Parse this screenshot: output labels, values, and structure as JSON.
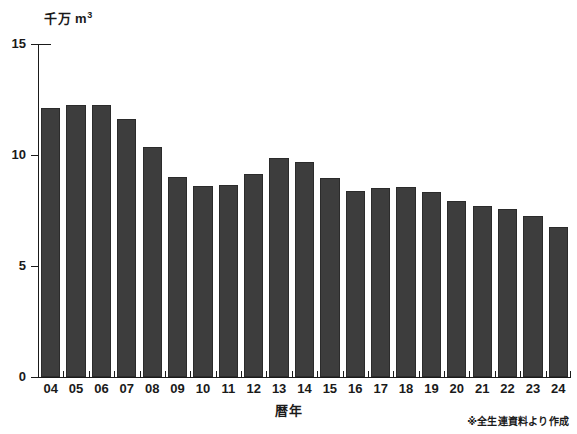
{
  "chart_data": {
    "type": "bar",
    "title": "",
    "subtitle": "",
    "unit_label": "千万 m",
    "unit_exponent": "3",
    "xlabel": "暦年",
    "ylabel": "千万 m3",
    "ylim": [
      0,
      15
    ],
    "yticks": [
      0,
      5,
      10,
      15
    ],
    "ytick_labels": [
      "0",
      "5",
      "10",
      "15"
    ],
    "grid": false,
    "legend": false,
    "categories": [
      "04",
      "05",
      "06",
      "07",
      "08",
      "09",
      "10",
      "11",
      "12",
      "13",
      "14",
      "15",
      "16",
      "17",
      "18",
      "19",
      "20",
      "21",
      "22",
      "23",
      "24"
    ],
    "values": [
      12.1,
      12.25,
      12.25,
      11.6,
      10.35,
      9.0,
      8.6,
      8.65,
      9.15,
      9.85,
      9.7,
      8.95,
      8.4,
      8.5,
      8.55,
      8.35,
      7.95,
      7.7,
      7.55,
      7.25,
      6.75
    ],
    "series": [
      {
        "name": "",
        "values": [
          12.1,
          12.25,
          12.25,
          11.6,
          10.35,
          9.0,
          8.6,
          8.65,
          9.15,
          9.85,
          9.7,
          8.95,
          8.4,
          8.5,
          8.55,
          8.35,
          7.95,
          7.7,
          7.55,
          7.25,
          6.75
        ]
      }
    ],
    "annotations": [
      "※全生連資料より作成"
    ],
    "colors": {
      "bar": "#3d3d3d",
      "bar_edge": "#2b2b2b",
      "axis": "#1a1a1a",
      "background": "#ffffff",
      "text": "#1a1a1a"
    }
  },
  "footer": {
    "source_note": "※全生連資料より作成"
  },
  "axis": {
    "y_unit_main": "千万 m",
    "y_unit_sup": "3",
    "x_title": "暦年"
  }
}
